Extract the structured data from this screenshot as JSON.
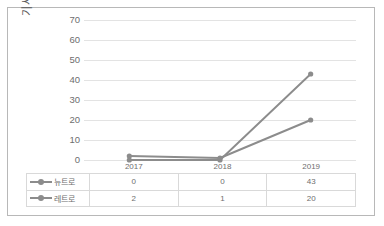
{
  "chart_data": {
    "type": "line",
    "title": "",
    "xlabel": "",
    "ylabel": "기사 건수",
    "categories": [
      "2017",
      "2018",
      "2019"
    ],
    "series": [
      {
        "name": "뉴트로",
        "values": [
          0,
          0,
          43
        ],
        "color": "#8c8c8c"
      },
      {
        "name": "레트로",
        "values": [
          2,
          1,
          20
        ],
        "color": "#8c8c8c"
      }
    ],
    "ylim": [
      0,
      70
    ],
    "yticks": [
      0,
      10,
      20,
      30,
      40,
      50,
      60,
      70
    ],
    "ytick_labels": [
      "0",
      "10",
      "20",
      "30",
      "40",
      "50",
      "60",
      "70"
    ],
    "grid": true,
    "legend_position": "data-table",
    "has_data_table": true,
    "marker": "circle"
  },
  "table": {
    "header": [
      "",
      "2017",
      "2018",
      "2019"
    ],
    "rows": [
      {
        "label": "뉴트로",
        "cells": [
          "0",
          "0",
          "43"
        ]
      },
      {
        "label": "레트로",
        "cells": [
          "2",
          "1",
          "20"
        ]
      }
    ]
  },
  "colors": {
    "series1": "#8c8c8c",
    "series2": "#8c8c8c",
    "gridline": "#e3e3e3",
    "border": "#b8b8b8",
    "text": "#6e6e6e",
    "table_border": "#d9d9d9"
  }
}
